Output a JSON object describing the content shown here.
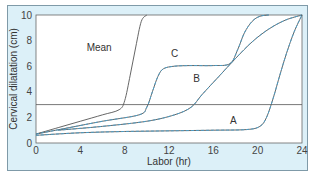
{
  "chart_data": {
    "type": "line",
    "title": "",
    "xlabel": "Labor (hr)",
    "ylabel": "Cervical dilatation (cm)",
    "xlim": [
      0,
      24
    ],
    "ylim": [
      0,
      10
    ],
    "xticks": [
      0,
      4,
      8,
      12,
      16,
      20,
      24
    ],
    "yticks": [
      0,
      2,
      4,
      6,
      8,
      10
    ],
    "grid": false,
    "reference_line": {
      "y": 3
    },
    "series": [
      {
        "name": "Mean",
        "style": "solid",
        "color": "#555555",
        "x": [
          0,
          2,
          4,
          6,
          7.5,
          8.0,
          8.5,
          9.0,
          9.5,
          10.0
        ],
        "y": [
          0.7,
          1.2,
          1.7,
          2.2,
          2.6,
          3.3,
          5.3,
          7.5,
          9.5,
          10.0
        ]
      },
      {
        "name": "C",
        "style": "solid+blue-dashed",
        "color": "#555555",
        "accent": "#4aa0cc",
        "x": [
          0,
          3,
          6,
          9.3,
          10.0,
          10.5,
          11.0,
          11.5,
          12.5,
          14,
          16,
          17.5,
          18.2,
          18.8,
          19.5,
          20.2,
          21
        ],
        "y": [
          0.7,
          1.2,
          1.7,
          2.2,
          2.8,
          4.0,
          5.2,
          5.8,
          6.0,
          6.05,
          6.05,
          6.2,
          7.3,
          8.6,
          9.5,
          9.9,
          10.0
        ]
      },
      {
        "name": "B",
        "style": "solid+blue-dashed",
        "color": "#555555",
        "accent": "#4aa0cc",
        "x": [
          2,
          6,
          10,
          12.5,
          14,
          15,
          16.5,
          18,
          19.5,
          21,
          22.5,
          24
        ],
        "y": [
          1.0,
          1.3,
          1.7,
          2.2,
          2.8,
          3.8,
          5.2,
          6.6,
          7.9,
          8.9,
          9.6,
          10.0
        ]
      },
      {
        "name": "A",
        "style": "blue-dashed+solid",
        "color": "#555555",
        "accent": "#4aa0cc",
        "x": [
          0,
          4,
          8,
          12,
          16,
          19,
          20.2,
          20.8,
          21.4,
          22.0,
          22.6,
          23.3,
          24
        ],
        "y": [
          0.6,
          0.8,
          0.9,
          0.95,
          1.0,
          1.05,
          1.3,
          2.0,
          3.5,
          5.3,
          7.0,
          8.7,
          10.0
        ]
      }
    ],
    "annotations": [
      {
        "text": "Mean",
        "x": 5.7,
        "y": 7.2
      },
      {
        "text": "C",
        "x": 12.5,
        "y": 6.7
      },
      {
        "text": "B",
        "x": 14.5,
        "y": 4.8
      },
      {
        "text": "A",
        "x": 17.8,
        "y": 1.5
      }
    ]
  }
}
